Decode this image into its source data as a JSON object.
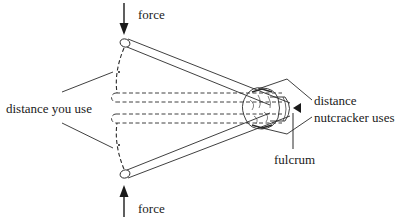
{
  "diagram": {
    "labels": {
      "force_top": "force",
      "force_bottom": "force",
      "distance_you_use": "distance you use",
      "distance_nutcracker_line1": "distance",
      "distance_nutcracker_line2": "nutcracker uses",
      "fulcrum": "fulcrum"
    },
    "components": [
      {
        "id": "top-handle",
        "description": "upper nutcracker arm (open position)"
      },
      {
        "id": "bottom-handle",
        "description": "lower nutcracker arm (open position)"
      },
      {
        "id": "closed-handles",
        "description": "dashed outline of arms in closed position"
      },
      {
        "id": "nut",
        "description": "nut held between arms near hinge"
      },
      {
        "id": "hinge",
        "description": "hinge end of nutcracker"
      },
      {
        "id": "force-arrow-top",
        "direction": "down"
      },
      {
        "id": "force-arrow-bottom",
        "direction": "up"
      },
      {
        "id": "fulcrum-pointer",
        "direction": "left"
      }
    ],
    "colors": {
      "ink": "#1a1a1a",
      "background": "#ffffff"
    }
  }
}
